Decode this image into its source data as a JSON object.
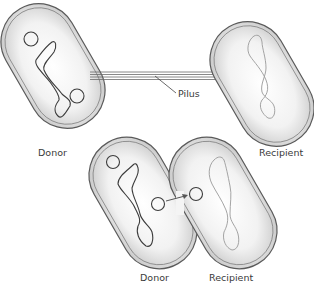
{
  "diagram": {
    "labels": {
      "pilus": "Pilus",
      "top_donor": "Donor",
      "top_recipient": "Recipient",
      "bottom_donor": "Donor",
      "bottom_recipient": "Recipient"
    },
    "colors": {
      "cell_fill_center": "#ffffff",
      "cell_fill_edge": "#c8c8c8",
      "outline": "#5a5a5a",
      "dna_donor": "#3c3c3c",
      "dna_recipient": "#9a9a9a",
      "arrow": "#555555"
    }
  }
}
